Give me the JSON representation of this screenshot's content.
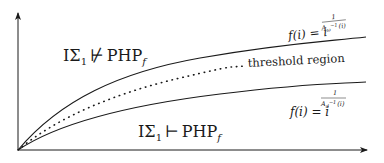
{
  "diagram": {
    "type": "growth-regions",
    "axes": {
      "x_axis": "horizontal arrow (i)",
      "y_axis": "vertical arrow (f(i))"
    },
    "regions": {
      "upper": {
        "prefix": "IΣ",
        "subscript": "1",
        "relation": "⊬",
        "rhs": "PHP",
        "rhs_subscript": "f"
      },
      "lower": {
        "prefix": "IΣ",
        "subscript": "1",
        "relation": "⊢",
        "rhs": "PHP",
        "rhs_subscript": "f"
      }
    },
    "curves": {
      "upper": {
        "style": "solid",
        "formula_lhs": "f(i) = i",
        "exponent_numerator": "1",
        "exponent_denominator_base": "A",
        "exponent_denominator_sub": "ω",
        "exponent_denominator_sup": "−1",
        "exponent_denominator_arg": "(i)"
      },
      "middle": {
        "style": "dotted",
        "label": "threshold region"
      },
      "lower": {
        "style": "solid",
        "formula_lhs": "f(i) = i",
        "exponent_numerator": "1",
        "exponent_denominator_base": "A",
        "exponent_denominator_sub": "d",
        "exponent_denominator_sup": "−1",
        "exponent_denominator_arg": "(i)"
      }
    },
    "colors": {
      "ink": "#1a1a1a",
      "background": "#ffffff"
    }
  }
}
